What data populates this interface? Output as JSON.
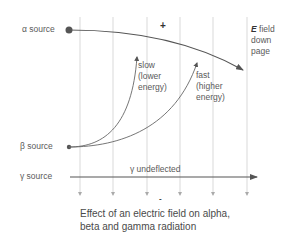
{
  "diagram": {
    "title": "Effect of an electric field on alpha, beta and gamma radiation",
    "caption_line1": "Effect of an electric field on alpha,",
    "caption_line2": "beta and gamma radiation",
    "sources": {
      "alpha": "α source",
      "beta": "β source",
      "gamma": "γ source"
    },
    "field_label": {
      "symbol": "E",
      "line1": " field",
      "line2": "down",
      "line3": "page"
    },
    "plates": {
      "positive": "+",
      "negative": "-"
    },
    "beta_annotations": {
      "slow": [
        "slow",
        "(lower",
        "energy)"
      ],
      "fast": [
        "fast",
        "(higher",
        "energy)"
      ]
    },
    "gamma_label": "γ undeflected",
    "field_lines_x": [
      80,
      113,
      147,
      180,
      213,
      247
    ],
    "colors": {
      "line": "#555555",
      "field_line": "#cccccc",
      "text": "#555555"
    }
  }
}
